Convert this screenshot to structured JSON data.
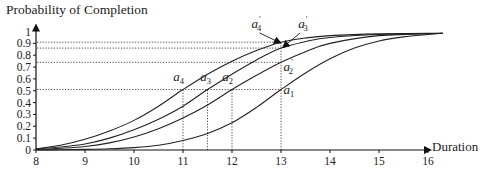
{
  "chart_data": {
    "type": "line",
    "title": "",
    "xlabel": "Duration",
    "ylabel": "Probability of Completion",
    "xlim": [
      8,
      16
    ],
    "ylim": [
      0,
      1
    ],
    "grid": false,
    "legend": null,
    "x_ticks": [
      8,
      9,
      10,
      11,
      12,
      13,
      14,
      15,
      16
    ],
    "y_ticks": [
      0,
      0.1,
      0.2,
      0.3,
      0.4,
      0.5,
      0.6,
      0.7,
      0.8,
      0.9,
      1
    ],
    "y_tick_labels": [
      "0",
      "0.1",
      "0.2",
      "0.3",
      "0.4",
      "0.5",
      "0.6",
      "0.7",
      "0.8",
      "0.9",
      "1"
    ],
    "series": [
      {
        "name": "a4 curve",
        "x": [
          8,
          8.5,
          9,
          9.5,
          10,
          10.5,
          11,
          11.5,
          12,
          12.5,
          13,
          13.5,
          14,
          15,
          16.3
        ],
        "values": [
          0.01,
          0.04,
          0.09,
          0.16,
          0.25,
          0.37,
          0.51,
          0.64,
          0.75,
          0.84,
          0.91,
          0.945,
          0.965,
          0.98,
          0.985
        ]
      },
      {
        "name": "a3 curve",
        "x": [
          8,
          8.5,
          9,
          9.5,
          10,
          10.5,
          11,
          11.5,
          12,
          12.5,
          13,
          13.5,
          14,
          15,
          16.3
        ],
        "values": [
          0.01,
          0.025,
          0.05,
          0.1,
          0.17,
          0.26,
          0.37,
          0.51,
          0.64,
          0.76,
          0.86,
          0.915,
          0.95,
          0.975,
          0.985
        ]
      },
      {
        "name": "a2 curve",
        "x": [
          8,
          8.5,
          9,
          9.5,
          10,
          10.5,
          11,
          11.5,
          12,
          12.5,
          13,
          13.5,
          14,
          15,
          16.3
        ],
        "values": [
          0.005,
          0.015,
          0.03,
          0.06,
          0.11,
          0.18,
          0.27,
          0.38,
          0.51,
          0.63,
          0.74,
          0.83,
          0.9,
          0.965,
          0.985
        ]
      },
      {
        "name": "a1 curve",
        "x": [
          8,
          8.5,
          9,
          9.5,
          10,
          10.5,
          11,
          11.5,
          12,
          12.5,
          13,
          13.5,
          14,
          14.5,
          15,
          15.5,
          16,
          16.3
        ],
        "values": [
          0.0,
          0.002,
          0.005,
          0.01,
          0.02,
          0.04,
          0.08,
          0.14,
          0.23,
          0.36,
          0.51,
          0.65,
          0.77,
          0.86,
          0.92,
          0.955,
          0.975,
          0.985
        ]
      }
    ],
    "reference_lines": {
      "horizontal": [
        {
          "y": 0.91,
          "x_from": 8,
          "x_to": 13
        },
        {
          "y": 0.86,
          "x_from": 8,
          "x_to": 13
        },
        {
          "y": 0.74,
          "x_from": 8,
          "x_to": 13
        },
        {
          "y": 0.51,
          "x_from": 8,
          "x_to": 13
        }
      ],
      "vertical": [
        {
          "x": 11,
          "y_from": 0,
          "y_to": 0.51
        },
        {
          "x": 11.5,
          "y_from": 0,
          "y_to": 0.51
        },
        {
          "x": 12,
          "y_from": 0,
          "y_to": 0.51
        },
        {
          "x": 13,
          "y_from": 0,
          "y_to": 0.91
        }
      ]
    },
    "annotations": [
      {
        "label": "a",
        "sub": "4",
        "prime": false,
        "x": 11,
        "y": 0.51,
        "tx": 10.8,
        "ty": 0.58
      },
      {
        "label": "a",
        "sub": "3",
        "prime": false,
        "x": 11.5,
        "y": 0.51,
        "tx": 11.35,
        "ty": 0.58
      },
      {
        "label": "a",
        "sub": "2",
        "prime": false,
        "x": 12,
        "y": 0.51,
        "tx": 11.8,
        "ty": 0.58
      },
      {
        "label": "a",
        "sub": "1",
        "prime": false,
        "x": 13,
        "y": 0.51,
        "tx": 13.05,
        "ty": 0.47
      },
      {
        "label": "a",
        "sub": "2",
        "prime": true,
        "x": 13,
        "y": 0.74,
        "tx": 13.05,
        "ty": 0.67
      },
      {
        "label": "a",
        "sub": "4",
        "prime": true,
        "x": 13,
        "y": 0.91,
        "tx": 12.4,
        "ty": 1.03,
        "arrow_to": [
          12.98,
          0.905
        ]
      },
      {
        "label": "a",
        "sub": "3",
        "prime": true,
        "x": 13,
        "y": 0.86,
        "tx": 13.35,
        "ty": 1.03,
        "arrow_to": [
          13.05,
          0.87
        ]
      }
    ]
  },
  "axes": {
    "ylabel": "Probability of Completion",
    "xlabel": "Duration"
  }
}
